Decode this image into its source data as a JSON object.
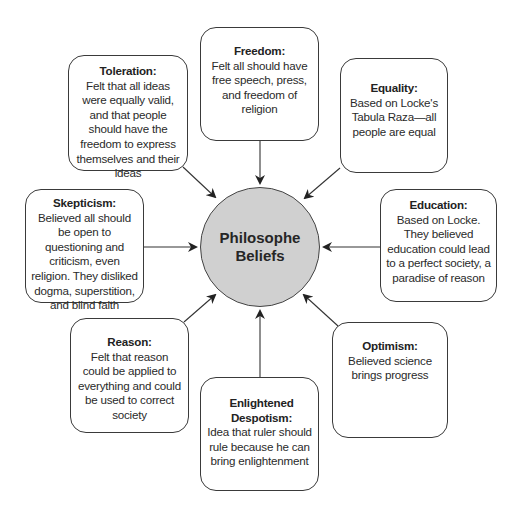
{
  "diagram": {
    "type": "concept-web",
    "center": {
      "line1": "Philosophe",
      "line2": "Beliefs",
      "fill_color": "#d0d0d0"
    },
    "nodes": [
      {
        "id": "toleration",
        "title": "Toleration:",
        "description": "Felt that all ideas were equally valid, and that people should have the freedom to express themselves and their ideas"
      },
      {
        "id": "freedom",
        "title": "Freedom:",
        "description": "Felt all should have free speech, press, and freedom of religion"
      },
      {
        "id": "equality",
        "title": "Equality:",
        "description": "Based on Locke's Tabula Raza—all people are equal"
      },
      {
        "id": "skepticism",
        "title": "Skepticism:",
        "description": "Believed all should be open to questioning and criticism, even religion. They disliked dogma, superstition, and blind faith"
      },
      {
        "id": "education",
        "title": "Education:",
        "description": "Based on Locke. They believed education could lead to a perfect society, a paradise of reason"
      },
      {
        "id": "reason",
        "title": "Reason:",
        "description": "Felt that reason could be applied to everything and could be used to correct society"
      },
      {
        "id": "enlightened-despotism",
        "title": "Enlightened Despotism:",
        "description": "Idea that ruler should rule because he can bring enlightenment"
      },
      {
        "id": "optimism",
        "title": "Optimism:",
        "description": "Believed science brings progress"
      }
    ],
    "edges_direction": "node-to-center",
    "line_color": "#333333"
  }
}
